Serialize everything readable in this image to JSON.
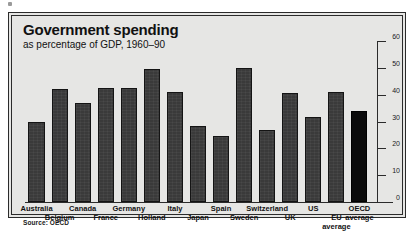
{
  "chart_data": {
    "type": "bar",
    "title": "Government spending",
    "subtitle": "as percentage of GDP, 1960–90",
    "xlabel": "",
    "ylabel": "",
    "ylim": [
      0,
      60
    ],
    "yticks": [
      0,
      10,
      20,
      30,
      40,
      50,
      60
    ],
    "ytick_labels": [
      "0",
      "10",
      "20",
      "30",
      "40",
      "50",
      "60"
    ],
    "grid": false,
    "legend": null,
    "source": "Source: OECD",
    "categories": [
      "Australia",
      "Belgium",
      "Canada",
      "France",
      "Germany",
      "Holland",
      "Italy",
      "Japan",
      "Spain",
      "Sweden",
      "Switzerland",
      "UK",
      "US",
      "EU average",
      "OECD average"
    ],
    "values": [
      30,
      42,
      37,
      42.5,
      42.5,
      49.5,
      41,
      28.5,
      24.5,
      50,
      27,
      40.5,
      31.5,
      41,
      34
    ],
    "bars": [
      {
        "label": "Australia",
        "value": 30,
        "row": 0,
        "highlight": false
      },
      {
        "label": "Belgium",
        "value": 42,
        "row": 1,
        "highlight": false
      },
      {
        "label": "Canada",
        "value": 37,
        "row": 0,
        "highlight": false
      },
      {
        "label": "France",
        "value": 42.5,
        "row": 1,
        "highlight": false
      },
      {
        "label": "Germany",
        "value": 42.5,
        "row": 0,
        "highlight": false
      },
      {
        "label": "Holland",
        "value": 49.5,
        "row": 1,
        "highlight": false
      },
      {
        "label": "Italy",
        "value": 41,
        "row": 0,
        "highlight": false
      },
      {
        "label": "Japan",
        "value": 28.5,
        "row": 1,
        "highlight": false
      },
      {
        "label": "Spain",
        "value": 24.5,
        "row": 0,
        "highlight": false
      },
      {
        "label": "Sweden",
        "value": 50,
        "row": 1,
        "highlight": false
      },
      {
        "label": "Switzerland",
        "value": 27,
        "row": 0,
        "highlight": false
      },
      {
        "label": "UK",
        "value": 40.5,
        "row": 1,
        "highlight": false
      },
      {
        "label": "US",
        "value": 31.5,
        "row": 0,
        "highlight": false
      },
      {
        "label": "EU",
        "value": 41,
        "row": 1,
        "highlight": false,
        "label2": "average",
        "label2row": 2
      },
      {
        "label": "OECD",
        "value": 34,
        "row": 0,
        "highlight": true,
        "label2": "average",
        "label2row": 1
      }
    ],
    "colors": {
      "bar": "#3a3a3a",
      "bar_highlight": "#0b0b0b",
      "background": "#e6e6e4",
      "border": "#2b2b2b",
      "text": "#111111"
    }
  }
}
